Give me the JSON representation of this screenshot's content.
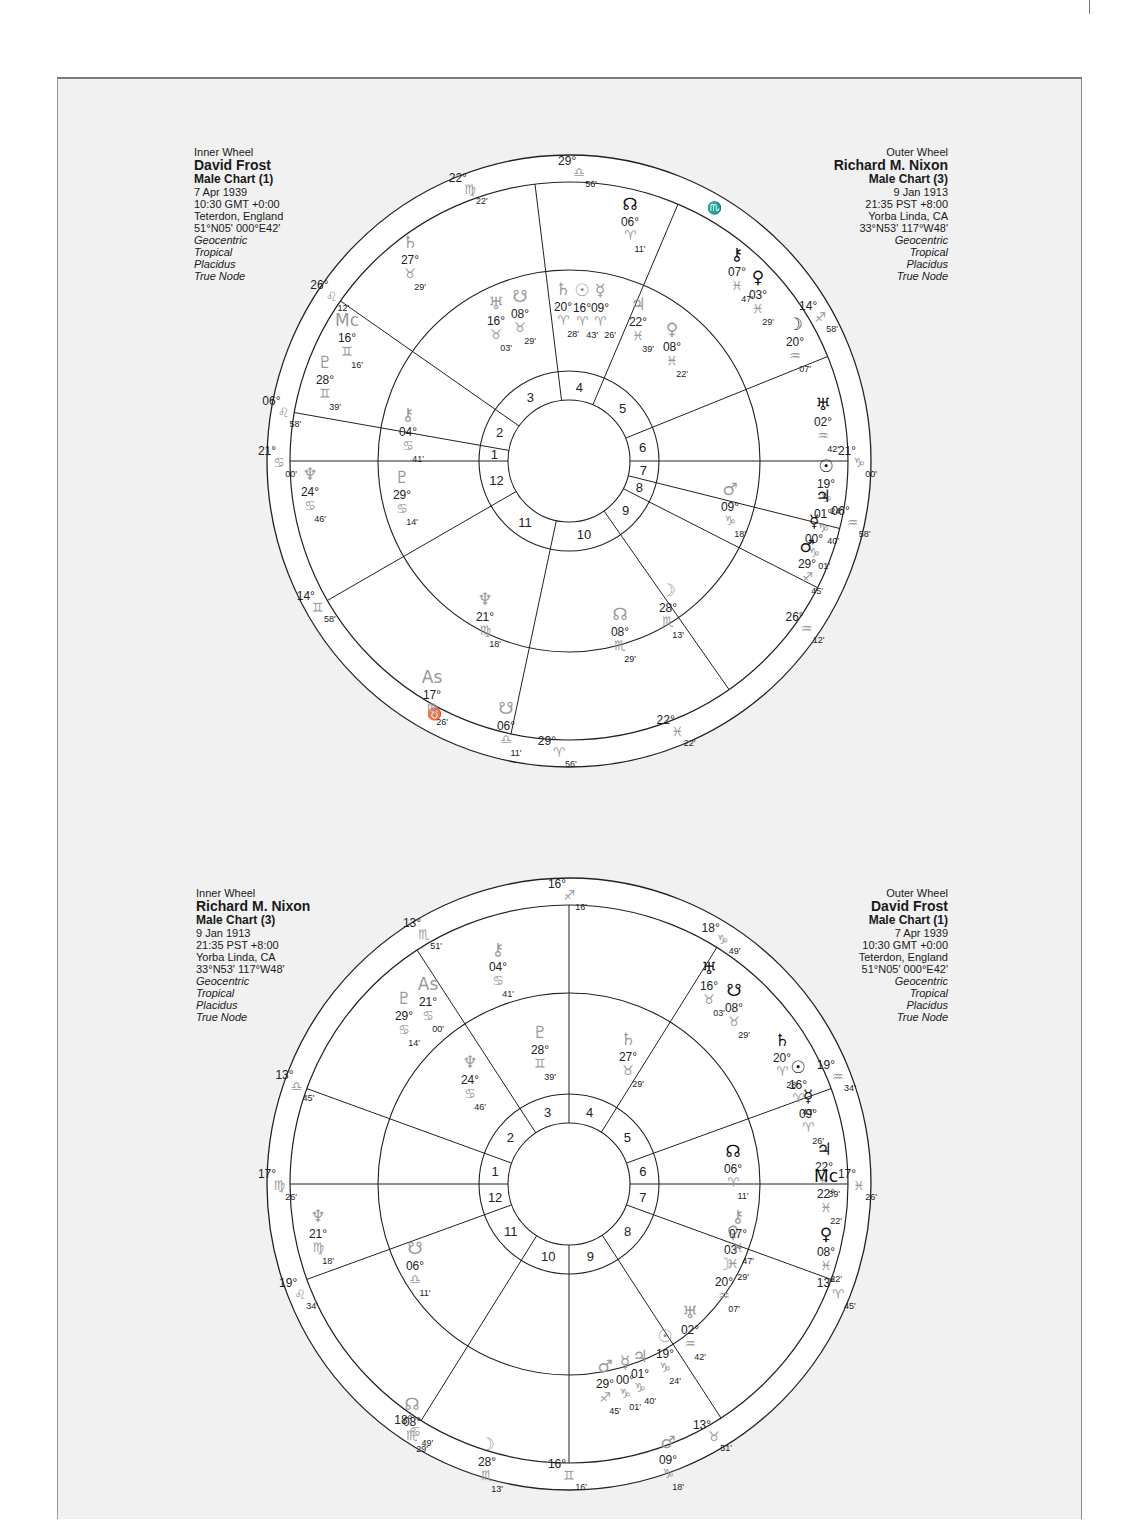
{
  "page": {
    "background": "#f1f1f1",
    "line_color": "#222222",
    "inner_planet_color": "#999999"
  },
  "charts": [
    {
      "id": "top",
      "inner_info": {
        "wheel_label": "Inner Wheel",
        "name": "David Frost",
        "chart_type": "Male Chart (1)",
        "date": "7 Apr 1939",
        "time": "10:30  GMT +0:00",
        "place": "Teterdon, England",
        "coords": "51°N05' 000°E42'",
        "settings": [
          "Geocentric",
          "Tropical",
          "Placidus",
          "True Node"
        ]
      },
      "outer_info": {
        "wheel_label": "Outer Wheel",
        "name": "Richard M. Nixon",
        "chart_type": "Male Chart (3)",
        "date": "9 Jan 1913",
        "time": "21:35  PST +8:00",
        "place": "Yorba Linda, CA",
        "coords": "33°N53' 117°W48'",
        "settings": [
          "Geocentric",
          "Tropical",
          "Placidus",
          "True Node"
        ]
      },
      "cusp_angles": [
        180,
        190,
        215,
        263,
        293,
        338,
        0,
        14,
        27,
        55,
        102,
        150
      ],
      "cusp_labels": [
        {
          "deg": "21°",
          "sign": "♋",
          "min": "00'",
          "angle": 180
        },
        {
          "deg": "06°",
          "sign": "♌",
          "min": "58'",
          "angle": 190
        },
        {
          "deg": "26°",
          "sign": "♌",
          "min": "12'",
          "angle": 215
        },
        {
          "deg": "22°",
          "sign": "♍",
          "min": "22'",
          "angle": 250
        },
        {
          "deg": "29°",
          "sign": "♎",
          "min": "56'",
          "angle": 272
        },
        {
          "deg": "♏",
          "sign": "",
          "min": "",
          "angle": 303
        },
        {
          "deg": "14°",
          "sign": "♐",
          "min": "58'",
          "angle": 330
        },
        {
          "deg": "21°",
          "sign": "♑",
          "min": "00'",
          "angle": 0
        },
        {
          "deg": "06°",
          "sign": "♒",
          "min": "58'",
          "angle": 12
        },
        {
          "deg": "26°",
          "sign": "♒",
          "min": "12'",
          "angle": 35
        },
        {
          "deg": "22°",
          "sign": "♓",
          "min": "22'",
          "angle": 68
        },
        {
          "deg": "29°",
          "sign": "♈",
          "min": "56'",
          "angle": 92
        },
        {
          "deg": "♉",
          "sign": "",
          "min": "",
          "angle": 115
        },
        {
          "deg": "14°",
          "sign": "♊",
          "min": "58'",
          "angle": 150
        }
      ],
      "inner_planets": [
        {
          "glyph": "♆",
          "name": "neptune",
          "text": "24° ♋ 46'",
          "x": 310,
          "y": 480
        },
        {
          "glyph": "♇",
          "name": "pluto",
          "text": "29° ♋ 14'",
          "x": 402,
          "y": 483
        },
        {
          "glyph": "⚷",
          "name": "chiron",
          "text": "04° ♋ 41'",
          "x": 408,
          "y": 420
        },
        {
          "glyph": "♇",
          "name": "pluto-outer-pos",
          "text": "28° ♊ 39'",
          "x": 325,
          "y": 368
        },
        {
          "glyph": "Mc",
          "name": "midheaven",
          "text": "16° ♊ 16'",
          "x": 347,
          "y": 326
        },
        {
          "glyph": "♄",
          "name": "saturn",
          "text": "27° ♉ 29'",
          "x": 410,
          "y": 248
        },
        {
          "glyph": "♅",
          "name": "uranus",
          "text": "16° ♉ 03'",
          "x": 496,
          "y": 309
        },
        {
          "glyph": "☋",
          "name": "south-node",
          "text": "08° ♉ 29'",
          "x": 520,
          "y": 302
        },
        {
          "glyph": "♄",
          "name": "saturn-2",
          "text": "20° ♈ 28'",
          "x": 563,
          "y": 295
        },
        {
          "glyph": "☉",
          "name": "sun",
          "text": "16° ♈ 43'",
          "x": 582,
          "y": 296
        },
        {
          "glyph": "☿",
          "name": "mercury",
          "text": "09° ♈ 26'",
          "x": 600,
          "y": 296
        },
        {
          "glyph": "♃",
          "name": "jupiter",
          "text": "22° ♓ 39'",
          "x": 638,
          "y": 310
        },
        {
          "glyph": "♀",
          "name": "venus",
          "text": "08° ♓ 22'",
          "x": 672,
          "y": 335
        },
        {
          "glyph": "♆",
          "name": "neptune-2",
          "text": "21° ♍ 18'",
          "x": 485,
          "y": 605
        },
        {
          "glyph": "As",
          "name": "ascendant",
          "text": "17° ♍ 26'",
          "x": 432,
          "y": 683
        },
        {
          "glyph": "☋",
          "name": "south-node-2",
          "text": "06° ♎ 11'",
          "x": 506,
          "y": 714
        },
        {
          "glyph": "☊",
          "name": "north-node",
          "text": "08° ♏ 29'",
          "x": 620,
          "y": 620
        },
        {
          "glyph": "☽",
          "name": "moon",
          "text": "28° ♏ 13'",
          "x": 668,
          "y": 596
        },
        {
          "glyph": "♂",
          "name": "mars",
          "text": "09° ♑ 18'",
          "x": 730,
          "y": 495
        }
      ],
      "outer_planets": [
        {
          "glyph": "☊",
          "name": "north-node",
          "text": "06° ♈ 11'",
          "x": 630,
          "y": 210
        },
        {
          "glyph": "⚷",
          "name": "chiron",
          "text": "07° ♓ 47'",
          "x": 737,
          "y": 260
        },
        {
          "glyph": "♀",
          "name": "venus",
          "text": "03° ♓ 29'",
          "x": 758,
          "y": 283
        },
        {
          "glyph": "☽",
          "name": "moon",
          "text": "20° ♒ 07'",
          "x": 795,
          "y": 330
        },
        {
          "glyph": "♅",
          "name": "uranus",
          "text": "02° ♒ 42'",
          "x": 823,
          "y": 410
        },
        {
          "glyph": "☉",
          "name": "sun",
          "text": "19° ♑ 24'",
          "x": 826,
          "y": 472
        },
        {
          "glyph": "♃",
          "name": "jupiter",
          "text": "01° ♑ 40'",
          "x": 823,
          "y": 502
        },
        {
          "glyph": "☿",
          "name": "mercury",
          "text": "00° ♑ 01'",
          "x": 814,
          "y": 527
        },
        {
          "glyph": "♂",
          "name": "mars",
          "text": "29° ♐ 45'",
          "x": 807,
          "y": 552
        }
      ]
    },
    {
      "id": "bottom",
      "inner_info": {
        "wheel_label": "Inner Wheel",
        "name": "Richard M. Nixon",
        "chart_type": "Male Chart (3)",
        "date": "9 Jan 1913",
        "time": "21:35  PST +8:00",
        "place": "Yorba Linda, CA",
        "coords": "33°N53' 117°W48'",
        "settings": [
          "Geocentric",
          "Tropical",
          "Placidus",
          "True Node"
        ]
      },
      "outer_info": {
        "wheel_label": "Outer Wheel",
        "name": "David Frost",
        "chart_type": "Male Chart (1)",
        "date": "7 Apr 1939",
        "time": "10:30  GMT +0:00",
        "place": "Teterdon, England",
        "coords": "51°N05' 000°E42'",
        "settings": [
          "Geocentric",
          "Tropical",
          "Placidus",
          "True Node"
        ]
      },
      "cusp_angles": [
        180,
        200,
        237,
        270,
        302,
        340,
        0,
        20,
        57,
        90,
        122,
        160
      ],
      "cusp_labels": [
        {
          "deg": "17°",
          "sign": "♍",
          "min": "26'",
          "angle": 180
        },
        {
          "deg": "13°",
          "sign": "♎",
          "min": "45'",
          "angle": 200
        },
        {
          "deg": "13°",
          "sign": "♏",
          "min": "51'",
          "angle": 240
        },
        {
          "deg": "16°",
          "sign": "♐",
          "min": "16'",
          "angle": 270
        },
        {
          "deg": "18°",
          "sign": "♑",
          "min": "49'",
          "angle": 302
        },
        {
          "deg": "19°",
          "sign": "♒",
          "min": "34'",
          "angle": 338
        },
        {
          "deg": "17°",
          "sign": "♓",
          "min": "26'",
          "angle": 0
        },
        {
          "deg": "13°",
          "sign": "♈",
          "min": "45'",
          "angle": 22
        },
        {
          "deg": "13°",
          "sign": "♉",
          "min": "51'",
          "angle": 60
        },
        {
          "deg": "16°",
          "sign": "♊",
          "min": "16'",
          "angle": 90
        },
        {
          "deg": "18°",
          "sign": "♋",
          "min": "49'",
          "angle": 122
        },
        {
          "deg": "19°",
          "sign": "♌",
          "min": "34'",
          "angle": 158
        }
      ],
      "inner_planets": [
        {
          "glyph": "♆",
          "name": "neptune",
          "text": "21° ♍ 18'",
          "x": 318,
          "y": 1222
        },
        {
          "glyph": "☋",
          "name": "south-node",
          "text": "06° ♎ 11'",
          "x": 415,
          "y": 1254
        },
        {
          "glyph": "☊",
          "name": "north-node",
          "text": "08° ♏ 29'",
          "x": 412,
          "y": 1410
        },
        {
          "glyph": "☽",
          "name": "moon",
          "text": "28° ♏ 13'",
          "x": 487,
          "y": 1450
        },
        {
          "glyph": "⚷",
          "name": "chiron",
          "text": "04° ♋ 41'",
          "x": 498,
          "y": 955
        },
        {
          "glyph": "As",
          "name": "ascendant",
          "text": "21° ♋ 00'",
          "x": 428,
          "y": 990
        },
        {
          "glyph": "♇",
          "name": "pluto",
          "text": "29° ♋ 14'",
          "x": 404,
          "y": 1004
        },
        {
          "glyph": "♆",
          "name": "neptune-outer",
          "text": "24° ♋ 46'",
          "x": 470,
          "y": 1068
        },
        {
          "glyph": "♇",
          "name": "pluto-2",
          "text": "28° ♊ 39'",
          "x": 540,
          "y": 1038
        },
        {
          "glyph": "♄",
          "name": "saturn",
          "text": "27° ♉ 29'",
          "x": 628,
          "y": 1045
        },
        {
          "glyph": "☉",
          "name": "sun",
          "text": "19° ♑ 24'",
          "x": 665,
          "y": 1342
        },
        {
          "glyph": "♃",
          "name": "jupiter",
          "text": "01° ♑ 40'",
          "x": 640,
          "y": 1362
        },
        {
          "glyph": "☿",
          "name": "mercury",
          "text": "00° ♑ 01'",
          "x": 625,
          "y": 1368
        },
        {
          "glyph": "♂",
          "name": "mars",
          "text": "29° ♐ 45'",
          "x": 605,
          "y": 1372
        },
        {
          "glyph": "♅",
          "name": "uranus",
          "text": "02° ♒ 42'",
          "x": 690,
          "y": 1318
        },
        {
          "glyph": "♂",
          "name": "mars-2",
          "text": "09° ♑ 18'",
          "x": 668,
          "y": 1448
        },
        {
          "glyph": "♀",
          "name": "venus",
          "text": "03° ♓ 29'",
          "x": 733,
          "y": 1238
        },
        {
          "glyph": "⚷",
          "name": "chiron-2",
          "text": "07° ♓ 47'",
          "x": 738,
          "y": 1222
        },
        {
          "glyph": "☽",
          "name": "moon-2",
          "text": "20° ♒ 07'",
          "x": 724,
          "y": 1270
        }
      ],
      "outer_planets": [
        {
          "glyph": "♅",
          "name": "uranus",
          "text": "16° ♉ 03'",
          "x": 709,
          "y": 974
        },
        {
          "glyph": "☋",
          "name": "south-node",
          "text": "08° ♉ 29'",
          "x": 734,
          "y": 996
        },
        {
          "glyph": "♄",
          "name": "saturn",
          "text": "20° ♈ 28'",
          "x": 782,
          "y": 1046
        },
        {
          "glyph": "☉",
          "name": "sun",
          "text": "16° ♈ 43'",
          "x": 798,
          "y": 1073
        },
        {
          "glyph": "☿",
          "name": "mercury",
          "text": "09° ♈ 26'",
          "x": 808,
          "y": 1102
        },
        {
          "glyph": "☊",
          "name": "north-node",
          "text": "06° ♈ 11'",
          "x": 733,
          "y": 1157
        },
        {
          "glyph": "♃",
          "name": "jupiter",
          "text": "22° ♓ 39'",
          "x": 824,
          "y": 1155
        },
        {
          "glyph": "Mc",
          "name": "midheaven",
          "text": "22° ♓ 22'",
          "x": 826,
          "y": 1182
        },
        {
          "glyph": "♀",
          "name": "venus",
          "text": "08° ♓ 22'",
          "x": 826,
          "y": 1240
        }
      ]
    }
  ]
}
